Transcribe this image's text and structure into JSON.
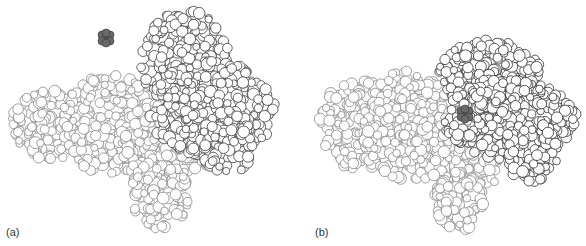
{
  "figure": {
    "panels": [
      {
        "id": "a",
        "label": "(a)",
        "description": "Space-filling model: protein with ligand separated (open conformation)",
        "ligand": {
          "x": 106,
          "y": 38,
          "color": "#6a6a6a"
        },
        "domains": [
          {
            "name": "large-domain",
            "stroke": "#8a8a8a",
            "blobs": [
              [
                10,
                90,
                95,
                160
              ],
              [
                60,
                75,
                160,
                175
              ],
              [
                120,
                100,
                215,
                185
              ],
              [
                130,
                160,
                190,
                230
              ]
            ]
          },
          {
            "name": "small-domain",
            "stroke": "#404040",
            "blobs": [
              [
                140,
                10,
                230,
                110
              ],
              [
                150,
                60,
                275,
                160
              ],
              [
                200,
                110,
                255,
                175
              ]
            ]
          }
        ]
      },
      {
        "id": "b",
        "label": "(b)",
        "description": "Space-filling model: ligand bound in closed cleft",
        "ligand": {
          "x": 172,
          "y": 114,
          "color": "#6a6a6a"
        },
        "domains": [
          {
            "name": "large-domain",
            "stroke": "#8a8a8a",
            "blobs": [
              [
                25,
                80,
                110,
                170
              ],
              [
                70,
                70,
                160,
                180
              ],
              [
                120,
                110,
                215,
                195
              ],
              [
                140,
                170,
                190,
                232
              ]
            ]
          },
          {
            "name": "small-domain",
            "stroke": "#333333",
            "blobs": [
              [
                145,
                40,
                250,
                110
              ],
              [
                150,
                80,
                283,
                160
              ],
              [
                210,
                120,
                265,
                182
              ]
            ]
          }
        ]
      }
    ]
  }
}
